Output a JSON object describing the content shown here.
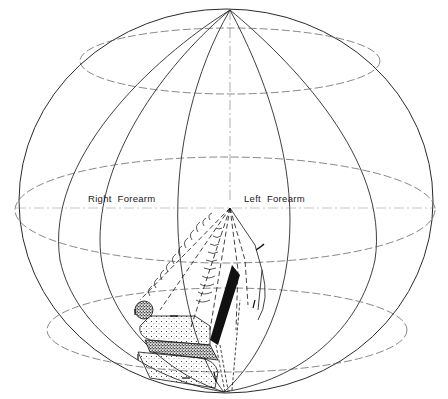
{
  "figure": {
    "type": "sphere-diagram",
    "labels": {
      "right_forearm": "Right  Forearm",
      "left_forearm": "Left  Forearm"
    },
    "colors": {
      "line": "#2a2a2a",
      "dashed": "#555555",
      "fill_dark": "#111111",
      "background": "#ffffff"
    }
  }
}
